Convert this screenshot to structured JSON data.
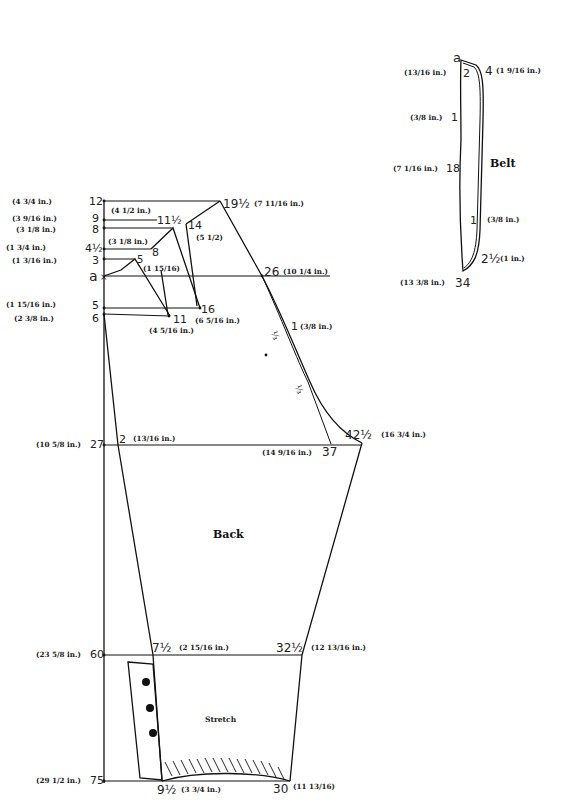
{
  "pieces": {
    "back": {
      "title": "Back",
      "stretch_label": "Stretch",
      "left_scale": [
        {
          "num": "12",
          "meas": "(4 3/4 in.)"
        },
        {
          "num": "9",
          "meas": "(3 9/16 in.)"
        },
        {
          "num": "8",
          "meas": "(3 1/8 in.)"
        },
        {
          "num": "4½",
          "meas": "(1 3/4 in.)"
        },
        {
          "num": "3",
          "meas": "(1 3/16 in.)"
        },
        {
          "num": "a",
          "meas": ""
        },
        {
          "num": "5",
          "meas": "(1 15/16 in.)"
        },
        {
          "num": "6",
          "meas": "(2 3/8 in.)"
        },
        {
          "num": "27",
          "meas": "(10 5/8 in.)"
        },
        {
          "num": "60",
          "meas": "(23 5/8 in.)"
        },
        {
          "num": "75",
          "meas": "(29 1/2 in.)"
        }
      ],
      "points": {
        "p19_5": {
          "num": "19½",
          "meas": "(7 11/16 in.)"
        },
        "p11_5": {
          "num": "11½",
          "meas": "(4 1/2 in.)"
        },
        "p14": {
          "num": "14",
          "meas": "(5 1/2)"
        },
        "p8": {
          "num": "8",
          "meas": "(3 1/8 in.)"
        },
        "p5": {
          "num": "5",
          "meas": "(1 15/16)"
        },
        "p26": {
          "num": "26",
          "meas": "(10 1/4 in.)"
        },
        "p16": {
          "num": "16",
          "meas": "(6 5/16 in.)"
        },
        "p11": {
          "num": "11",
          "meas": "(4 5/16 in.)"
        },
        "p1": {
          "num": "1",
          "meas": "(3/8 in.)"
        },
        "third_a": "⅓",
        "third_b": "⅓",
        "p2": {
          "num": "2",
          "meas": "(13/16 in.)"
        },
        "p37": {
          "num": "37",
          "meas": "(14 9/16 in.)"
        },
        "p42_5": {
          "num": "42½",
          "meas": "(16 3/4 in.)"
        },
        "p7_5": {
          "num": "7½",
          "meas": "(2 15/16 in.)"
        },
        "p32_5": {
          "num": "32½",
          "meas": "(12 13/16 in.)"
        },
        "p9_5": {
          "num": "9½",
          "meas": "(3 3/4 in.)"
        },
        "p30": {
          "num": "30",
          "meas": "(11 13/16)"
        }
      }
    },
    "belt": {
      "title": "Belt",
      "points": {
        "a": {
          "num": "a",
          "meas": ""
        },
        "p2": {
          "num": "2",
          "meas": "(13/16 in.)"
        },
        "p4": {
          "num": "4",
          "meas": "(1 9/16 in.)"
        },
        "p1_left": {
          "num": "1",
          "meas": "(3/8 in.)"
        },
        "p18": {
          "num": "18",
          "meas": "(7 1/16 in.)"
        },
        "p1_right": {
          "num": "1",
          "meas": "(3/8 in.)"
        },
        "p2_5": {
          "num": "2½",
          "meas": "(1 in.)"
        },
        "p34": {
          "num": "34",
          "meas": "(13 3/8 in.)"
        }
      }
    }
  }
}
